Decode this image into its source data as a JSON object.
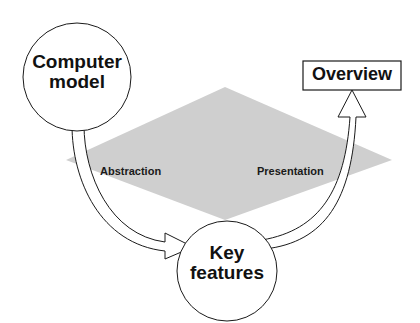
{
  "diagram": {
    "nodes": [
      {
        "id": "computer-model",
        "shape": "circle",
        "label_lines": [
          "Computer",
          "model"
        ]
      },
      {
        "id": "key-features",
        "shape": "circle",
        "label_lines": [
          "Key",
          "features"
        ]
      },
      {
        "id": "overview",
        "shape": "rectangle",
        "label": "Overview"
      }
    ],
    "edges": [
      {
        "from": "computer-model",
        "to": "key-features",
        "label": "Abstraction",
        "style": "hollow curved arrow"
      },
      {
        "from": "key-features",
        "to": "overview",
        "label": "Presentation",
        "style": "hollow curved arrow"
      }
    ],
    "background_shape": {
      "shape": "diamond",
      "color": "#cfcfcf"
    }
  },
  "colors": {
    "background": "#ffffff",
    "diamond": "#cfcfcf",
    "stroke": "#1a1a1a",
    "text": "#111111"
  }
}
